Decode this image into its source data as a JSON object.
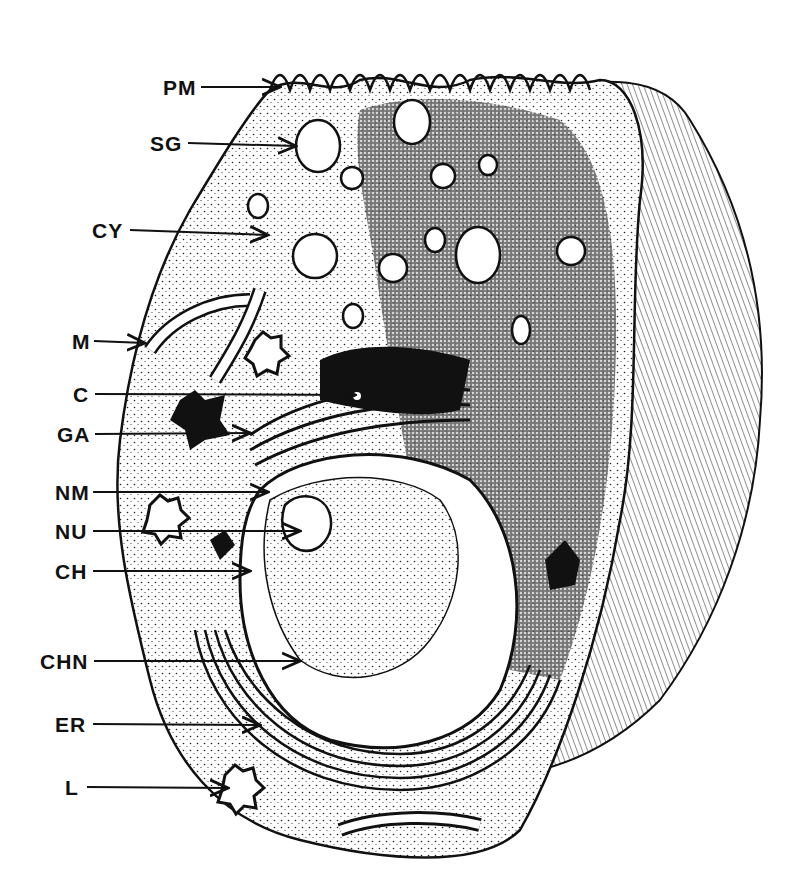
{
  "diagram": {
    "type": "labeled-illustration",
    "style": "black-and-white pen-and-ink stipple drawing",
    "colors": {
      "ink": "#111111",
      "paper": "#ffffff",
      "stipple": "#cfcfcf"
    }
  },
  "labels": [
    {
      "id": "PM",
      "text": "PM",
      "x": 163,
      "y": 77,
      "arrow_to": [
        280,
        87
      ]
    },
    {
      "id": "SG",
      "text": "SG",
      "x": 150,
      "y": 133,
      "arrow_to": [
        296,
        146
      ]
    },
    {
      "id": "CY",
      "text": "CY",
      "x": 92,
      "y": 220,
      "arrow_to": [
        268,
        235
      ]
    },
    {
      "id": "M",
      "text": "M",
      "x": 72,
      "y": 331,
      "arrow_to": [
        145,
        343
      ]
    },
    {
      "id": "C",
      "text": "C",
      "x": 73,
      "y": 384,
      "arrow_to": [
        355,
        395
      ]
    },
    {
      "id": "GA",
      "text": "GA",
      "x": 57,
      "y": 424,
      "arrow_to": [
        250,
        433
      ]
    },
    {
      "id": "NM",
      "text": "NM",
      "x": 55,
      "y": 482,
      "arrow_to": [
        268,
        492
      ]
    },
    {
      "id": "NU",
      "text": "NU",
      "x": 55,
      "y": 521,
      "arrow_to": [
        300,
        531
      ]
    },
    {
      "id": "CH",
      "text": "CH",
      "x": 55,
      "y": 561,
      "arrow_to": [
        250,
        571
      ]
    },
    {
      "id": "CHN",
      "text": "CHN",
      "x": 40,
      "y": 651,
      "arrow_to": [
        300,
        661
      ]
    },
    {
      "id": "ER",
      "text": "ER",
      "x": 55,
      "y": 714,
      "arrow_to": [
        260,
        725
      ]
    },
    {
      "id": "L",
      "text": "L",
      "x": 65,
      "y": 777,
      "arrow_to": [
        228,
        788
      ]
    }
  ]
}
